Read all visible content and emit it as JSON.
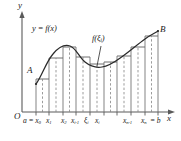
{
  "figure": {
    "caption_type": "riemann-sum-definite-integral-diagram",
    "axes": {
      "y_label": "y",
      "x_label": "x",
      "origin_label": "O"
    },
    "curve_labels": {
      "function": "y = f(x)",
      "sample_value": "f(ξ",
      "sample_value_sub": "i",
      "sample_value_close": ")"
    },
    "endpoints": {
      "left_point": "A",
      "right_point": "B"
    },
    "tick_labels": [
      {
        "main": "a = x",
        "sub": "0"
      },
      {
        "main": "x",
        "sub": "1"
      },
      {
        "main": "x",
        "sub": "2"
      },
      {
        "main": "x",
        "sub": "i-1"
      },
      {
        "main": "ξ",
        "sub": "i"
      },
      {
        "main": "x",
        "sub": "i"
      },
      {
        "main": "x",
        "sub": "n-1"
      },
      {
        "main": "x",
        "sub": "n"
      },
      {
        "main": "= b",
        "sub": ""
      }
    ],
    "colors": {
      "axis": "#5a5a5a",
      "curve": "#2b2b2b",
      "rectangle_edge": "#6e6e6e",
      "sample_dash": "#8a8a8a",
      "text": "#1c1c1c",
      "background": "#ffffff"
    },
    "geometry": {
      "partition_count": 9,
      "x_axis_y": 112,
      "y_axis_x": 22,
      "a_x": 36,
      "b_x": 158
    }
  }
}
